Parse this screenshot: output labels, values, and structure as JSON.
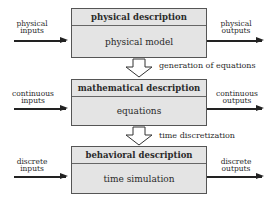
{
  "blocks": [
    {
      "title": "physical description",
      "content": "physical model",
      "input": "physical inputs",
      "output": "physical outputs",
      "input_lines": [
        "physical",
        "inputs"
      ],
      "output_lines": [
        "physical",
        "outputs"
      ]
    },
    {
      "title": "mathematical description",
      "content": "equations",
      "input": "continuous inputs",
      "output": "continuous outputs",
      "input_lines": [
        "continuous",
        "inputs"
      ],
      "output_lines": [
        "continuous",
        "outputs"
      ]
    },
    {
      "title": "behavioral description",
      "content": "time simulation",
      "input": "discrete inputs",
      "output": "discrete outputs",
      "input_lines": [
        "discrete",
        "inputs"
      ],
      "output_lines": [
        "discrete",
        "outputs"
      ]
    }
  ],
  "transitions": [
    {
      "label": "generation of equations"
    },
    {
      "label": "time discretization"
    }
  ],
  "colors": {
    "box_fill": "#e4e4e4",
    "border": "#555555",
    "arrow": "#222222"
  }
}
